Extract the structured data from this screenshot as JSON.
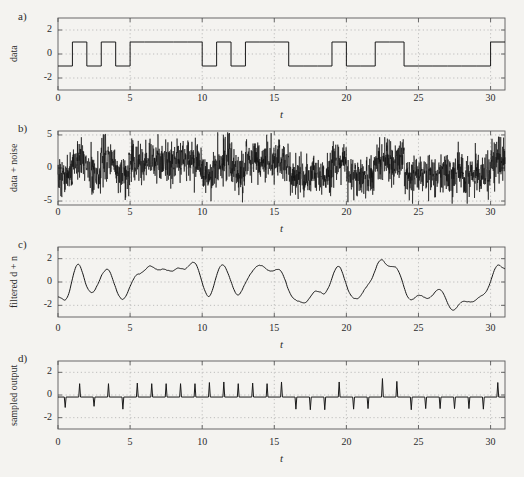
{
  "figure": {
    "background_color": "#f4f3f0",
    "ink_color": "#1a1a1a",
    "axis_color": "#5a5a5a",
    "grid_color": "#a8a8a8"
  },
  "panels": [
    {
      "letter": "a)",
      "ylabel": "data",
      "xlabel": "t",
      "yticks": [
        "2",
        "0",
        "-2"
      ],
      "xticks": [
        "0",
        "5",
        "10",
        "15",
        "20",
        "25",
        "30"
      ]
    },
    {
      "letter": "b)",
      "ylabel": "data + noise",
      "xlabel": "t",
      "yticks": [
        "5",
        "0",
        "-5"
      ],
      "xticks": [
        "0",
        "5",
        "10",
        "15",
        "20",
        "25",
        "30"
      ]
    },
    {
      "letter": "c)",
      "ylabel": "filtered d + n",
      "xlabel": "t",
      "yticks": [
        "2",
        "0",
        "-2"
      ],
      "xticks": [
        "0",
        "5",
        "10",
        "15",
        "20",
        "25",
        "30"
      ]
    },
    {
      "letter": "d)",
      "ylabel": "sampled output",
      "xlabel": "t",
      "yticks": [
        "2",
        "0",
        "-2"
      ],
      "xticks": [
        "0",
        "5",
        "10",
        "15",
        "20",
        "25",
        "30"
      ]
    }
  ],
  "chart_data": [
    {
      "type": "line",
      "title": "",
      "panel": "a",
      "ylabel": "data",
      "xlabel": "t",
      "xlim": [
        0,
        31
      ],
      "ylim": [
        -3,
        3
      ],
      "yticks": [
        -2,
        0,
        2
      ],
      "xticks": [
        0,
        5,
        10,
        15,
        20,
        25,
        30
      ],
      "grid": true,
      "description": "Binary NRZ data waveform, levels +1 and -1, one bit per unit of t",
      "bit_levels": [
        -1,
        1,
        -1,
        1,
        -1,
        1,
        1,
        1,
        1,
        1,
        -1,
        1,
        -1,
        1,
        1,
        1,
        -1,
        -1,
        -1,
        1,
        -1,
        -1,
        1,
        1,
        -1,
        -1,
        -1,
        -1,
        -1,
        -1,
        1
      ]
    },
    {
      "type": "line",
      "panel": "b",
      "ylabel": "data + noise",
      "xlabel": "t",
      "xlim": [
        0,
        31
      ],
      "ylim": [
        -5.6,
        5.6
      ],
      "yticks": [
        -5,
        0,
        5
      ],
      "xticks": [
        0,
        5,
        10,
        15,
        20,
        25,
        30
      ],
      "grid": true,
      "description": "Data waveform buried in broadband Gaussian noise; noise peaks clip near +/-5",
      "noise_std": 1.6,
      "signal_amplitude": 1.0
    },
    {
      "type": "line",
      "panel": "c",
      "ylabel": "filtered d + n",
      "xlabel": "t",
      "xlim": [
        0,
        31
      ],
      "ylim": [
        -3,
        3
      ],
      "yticks": [
        -2,
        0,
        2
      ],
      "xticks": [
        0,
        5,
        10,
        15,
        20,
        25,
        30
      ],
      "grid": true,
      "description": "Output of matched/low-pass filter; smoothed trace tracking the underlying bit levels, peaks about +2 and -2.3"
    },
    {
      "type": "line",
      "panel": "d",
      "ylabel": "sampled output",
      "xlabel": "t",
      "xlim": [
        0,
        31
      ],
      "ylim": [
        -3,
        3
      ],
      "yticks": [
        -2,
        0,
        2
      ],
      "xticks": [
        0,
        5,
        10,
        15,
        20,
        25,
        30
      ],
      "grid": true,
      "description": "Impulse train sampled at bit-centre instants t = k + 0.5; spike sign follows the recovered bit",
      "sample_times": [
        0.5,
        1.5,
        2.5,
        3.5,
        4.5,
        5.5,
        6.5,
        7.5,
        8.5,
        9.5,
        10.5,
        11.5,
        12.5,
        13.5,
        14.5,
        15.5,
        16.5,
        17.5,
        18.5,
        19.5,
        20.5,
        21.5,
        22.5,
        23.5,
        24.5,
        25.5,
        26.5,
        27.5,
        28.5,
        29.5,
        30.5
      ],
      "sample_values": [
        -1.1,
        1.0,
        -1.0,
        1.0,
        -1.25,
        1.05,
        1.0,
        1.0,
        1.0,
        1.0,
        1.1,
        1.15,
        1.0,
        1.05,
        1.0,
        1.15,
        -1.25,
        -1.3,
        -1.3,
        1.15,
        -1.25,
        -1.2,
        1.45,
        1.2,
        -1.3,
        -1.2,
        -1.2,
        -1.2,
        -1.2,
        -1.25,
        1.1
      ]
    }
  ]
}
